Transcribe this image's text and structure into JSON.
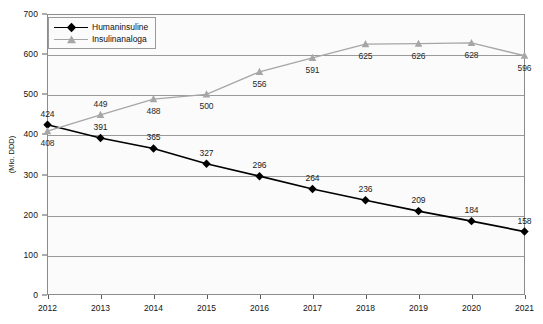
{
  "chart_data": {
    "type": "line",
    "title": "",
    "xlabel": "",
    "ylabel": "(Mio. DDD)",
    "categories": [
      "2012",
      "2013",
      "2014",
      "2015",
      "2016",
      "2017",
      "2018",
      "2019",
      "2020",
      "2021"
    ],
    "ylim": [
      0,
      700
    ],
    "y_ticks": [
      0,
      100,
      200,
      300,
      400,
      500,
      600,
      700
    ],
    "grid": true,
    "legend_position": "top-left",
    "series": [
      {
        "name": "Humaninsuline",
        "color": "#000000",
        "marker": "diamond",
        "values": [
          424,
          391,
          365,
          327,
          296,
          264,
          236,
          209,
          184,
          158
        ],
        "label_positions": [
          "above",
          "above",
          "above",
          "above",
          "above",
          "above",
          "above",
          "above",
          "above",
          "above"
        ]
      },
      {
        "name": "Insulinanaloga",
        "color": "#a6a6a6",
        "marker": "triangle",
        "values": [
          408,
          449,
          488,
          500,
          556,
          591,
          625,
          626,
          628,
          596
        ],
        "label_positions": [
          "below",
          "above",
          "below",
          "below",
          "below",
          "below",
          "below",
          "below",
          "below",
          "below"
        ]
      }
    ]
  },
  "axis": {
    "y_title": "(Mio. DDD)",
    "y_tick_labels": [
      "700",
      "600",
      "500",
      "400",
      "300",
      "200",
      "100",
      "0"
    ],
    "x_tick_labels": [
      "2012",
      "2013",
      "2014",
      "2015",
      "2016",
      "2017",
      "2018",
      "2019",
      "2020",
      "2021"
    ]
  },
  "legend": {
    "items": [
      {
        "label": "Humaninsuline"
      },
      {
        "label": "Insulinanaloga"
      }
    ]
  }
}
